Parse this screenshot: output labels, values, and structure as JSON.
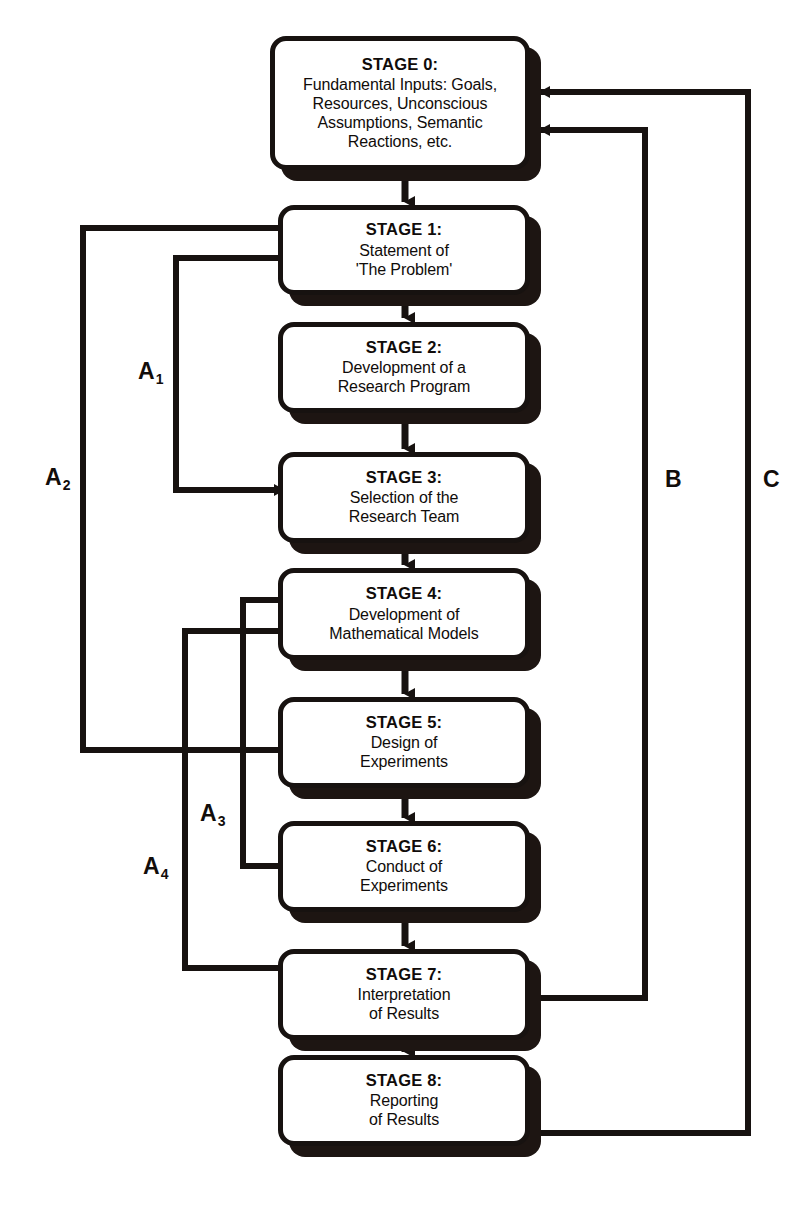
{
  "diagram": {
    "type": "flowchart",
    "ink_color": "#171210",
    "background_color": "#ffffff",
    "stages": [
      {
        "id": "stage-0",
        "title": "STAGE 0:",
        "lines": [
          "Fundamental Inputs: Goals,",
          "Resources, Unconscious",
          "Assumptions, Semantic",
          "Reactions, etc."
        ]
      },
      {
        "id": "stage-1",
        "title": "STAGE 1:",
        "lines": [
          "Statement of",
          "'The Problem'"
        ]
      },
      {
        "id": "stage-2",
        "title": "STAGE 2:",
        "lines": [
          "Development of a",
          "Research Program"
        ]
      },
      {
        "id": "stage-3",
        "title": "STAGE 3:",
        "lines": [
          "Selection of the",
          "Research Team"
        ]
      },
      {
        "id": "stage-4",
        "title": "STAGE 4:",
        "lines": [
          "Development of",
          "Mathematical Models"
        ]
      },
      {
        "id": "stage-5",
        "title": "STAGE 5:",
        "lines": [
          "Design of",
          "Experiments"
        ]
      },
      {
        "id": "stage-6",
        "title": "STAGE 6:",
        "lines": [
          "Conduct of",
          "Experiments"
        ]
      },
      {
        "id": "stage-7",
        "title": "STAGE 7:",
        "lines": [
          "Interpretation",
          "of Results"
        ]
      },
      {
        "id": "stage-8",
        "title": "STAGE 8:",
        "lines": [
          "Reporting",
          "of Results"
        ]
      }
    ],
    "feedback_loops": [
      {
        "id": "loop-a1",
        "base": "A",
        "subscript": "1",
        "from": "stage-3",
        "to": "stage-1",
        "side": "left"
      },
      {
        "id": "loop-a2",
        "base": "A",
        "subscript": "2",
        "from": "stage-5",
        "to": "stage-1",
        "side": "left"
      },
      {
        "id": "loop-a3",
        "base": "A",
        "subscript": "3",
        "from": "stage-6",
        "to": "stage-4",
        "side": "left"
      },
      {
        "id": "loop-a4",
        "base": "A",
        "subscript": "4",
        "from": "stage-7",
        "to": "stage-4",
        "side": "left"
      },
      {
        "id": "loop-b",
        "base": "B",
        "subscript": "",
        "from": "stage-7",
        "to": "stage-0",
        "side": "right"
      },
      {
        "id": "loop-c",
        "base": "C",
        "subscript": "",
        "from": "stage-8",
        "to": "stage-0",
        "side": "right"
      }
    ],
    "main_flow": [
      "stage-0",
      "stage-1",
      "stage-2",
      "stage-3",
      "stage-4",
      "stage-5",
      "stage-6",
      "stage-7",
      "stage-8"
    ]
  }
}
